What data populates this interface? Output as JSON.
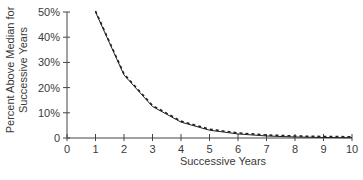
{
  "chart_data": {
    "type": "line",
    "title": "",
    "xlabel": "Successive Years",
    "ylabel_lines": [
      "Percent Above Median for",
      "Successive Years"
    ],
    "x_ticks": [
      "0",
      "1",
      "2",
      "3",
      "4",
      "5",
      "6",
      "7",
      "8",
      "9",
      "10"
    ],
    "y_ticks": [
      "0",
      "10%",
      "20%",
      "30%",
      "40%",
      "50%"
    ],
    "xlim": [
      0,
      10
    ],
    "ylim": [
      0,
      50
    ],
    "grid": false,
    "legend": null,
    "x": [
      1,
      2,
      3,
      4,
      5,
      6,
      7,
      8,
      9,
      10
    ],
    "series": [
      {
        "name": "Actual",
        "style": "solid",
        "values": [
          50,
          25,
          12.5,
          6.3,
          3.1,
          1.6,
          0.8,
          0.4,
          0.2,
          0.1
        ]
      },
      {
        "name": "Expected",
        "style": "dashed",
        "values": [
          50,
          25,
          12.5,
          6.3,
          3.1,
          1.6,
          0.8,
          0.4,
          0.2,
          0.1
        ]
      }
    ]
  }
}
